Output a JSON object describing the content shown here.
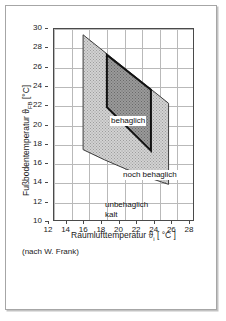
{
  "chart_data": {
    "type": "area",
    "title": "",
    "subtitle": "",
    "xlabel_text": "Raumlufttemperatur",
    "xlabel_symbol": "ϑ",
    "xlabel_subscript": "i",
    "xlabel_unit": "[ °C ]",
    "ylabel_text": "Fußbodentemperatur",
    "ylabel_symbol": "ϑ",
    "ylabel_subscript": "FB",
    "ylabel_unit": "[°C]",
    "xlim": [
      12,
      28
    ],
    "ylim": [
      10,
      30
    ],
    "xticks": [
      12,
      14,
      16,
      18,
      20,
      22,
      24,
      26,
      28
    ],
    "yticks": [
      30,
      28,
      26,
      24,
      22,
      20,
      18,
      16,
      14,
      12,
      10
    ],
    "grid": true,
    "legend_position": "none",
    "source_note": "(nach W. Frank)",
    "regions": [
      {
        "name": "noch behaglich",
        "label": "noch behaglich",
        "fill": "light-stipple",
        "fill_color": "#d2d2d2",
        "vertices": [
          [
            15.3,
            29.4
          ],
          [
            25.0,
            22.3
          ],
          [
            25.0,
            13.9
          ],
          [
            15.3,
            17.5
          ]
        ]
      },
      {
        "name": "behaglich",
        "label": "behaglich",
        "fill": "dark-stipple",
        "fill_color": "#9a9a9a",
        "vertices": [
          [
            18.0,
            27.3
          ],
          [
            23.0,
            23.7
          ],
          [
            23.0,
            17.4
          ],
          [
            18.0,
            21.9
          ]
        ]
      },
      {
        "name": "unbehaglich kalt",
        "label": "unbehaglich kalt",
        "label_lines": [
          "unbehaglich",
          "kalt"
        ],
        "fill": "none",
        "fill_color": "#ffffff",
        "vertices": []
      }
    ],
    "colors": {
      "axis": "#4a4a4a",
      "grid": "#b9b9b9",
      "outer_region": "#d2d2d2",
      "inner_region": "#9a9a9a",
      "inner_outline": "#111111",
      "text": "#1a1a1a",
      "frame_border": "#a6a6a6"
    }
  },
  "axis_labels": {
    "y_full": "Fußbodentemperatur ϑFB [°C]",
    "x_full": "Raumlufttemperatur ϑi [ °C ]"
  },
  "zone_labels": {
    "behaglich": "behaglich",
    "noch_behaglich": "noch behaglich",
    "unbehaglich_line1": "unbehaglich",
    "unbehaglich_line2": "kalt"
  },
  "footer": {
    "source": "(nach W. Frank)"
  }
}
